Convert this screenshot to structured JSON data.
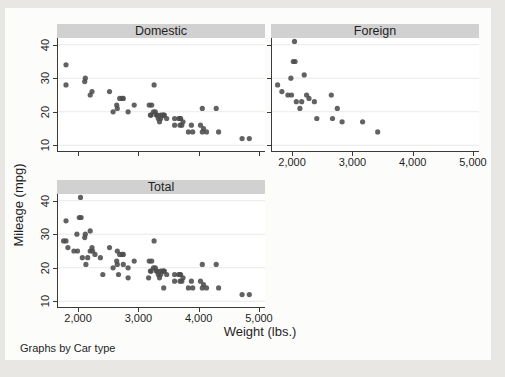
{
  "chart_data": {
    "type": "scatter",
    "xlabel": "Weight (lbs.)",
    "ylabel": "Mileage (mpg)",
    "caption": "Graphs by Car type",
    "legend": "none",
    "grid": true,
    "xlim": [
      1650,
      5100
    ],
    "ylim": [
      8,
      42
    ],
    "x_ticks": [
      {
        "v": 2000,
        "label": "2,000"
      },
      {
        "v": 3000,
        "label": "3,000"
      },
      {
        "v": 4000,
        "label": "4,000"
      },
      {
        "v": 5000,
        "label": "5,000"
      }
    ],
    "y_ticks": [
      {
        "v": 10,
        "label": "10"
      },
      {
        "v": 20,
        "label": "20"
      },
      {
        "v": 30,
        "label": "30"
      },
      {
        "v": 40,
        "label": "40"
      }
    ],
    "colors": {
      "marker": "#4c4c4c",
      "header_bg": "#d1d1d1",
      "grid": "#e9e9e6",
      "axis": "#3a3a3a",
      "text": "#1f1f1f",
      "figure_bg": "#fcfcfb",
      "page_bg": "#e8e7e3"
    },
    "marker_radius": 2.6,
    "panels": [
      {
        "title": "Domestic",
        "points": [
          [
            2930,
            22
          ],
          [
            3350,
            17
          ],
          [
            2640,
            22
          ],
          [
            3250,
            20
          ],
          [
            4080,
            15
          ],
          [
            3670,
            18
          ],
          [
            2230,
            26
          ],
          [
            3280,
            20
          ],
          [
            3880,
            16
          ],
          [
            3400,
            19
          ],
          [
            4330,
            14
          ],
          [
            3900,
            14
          ],
          [
            4290,
            21
          ],
          [
            2110,
            29
          ],
          [
            3690,
            16
          ],
          [
            3180,
            22
          ],
          [
            3220,
            22
          ],
          [
            2750,
            24
          ],
          [
            3430,
            19
          ],
          [
            2120,
            30
          ],
          [
            3600,
            18
          ],
          [
            3600,
            16
          ],
          [
            3740,
            17
          ],
          [
            1800,
            28
          ],
          [
            2650,
            21
          ],
          [
            4840,
            12
          ],
          [
            4720,
            12
          ],
          [
            3830,
            14
          ],
          [
            2580,
            20
          ],
          [
            4060,
            14
          ],
          [
            3720,
            16
          ],
          [
            3370,
            18
          ],
          [
            4130,
            14
          ],
          [
            2830,
            20
          ],
          [
            4060,
            21
          ],
          [
            3310,
            19
          ],
          [
            3300,
            19
          ],
          [
            3690,
            18
          ],
          [
            3370,
            19
          ],
          [
            2730,
            24
          ],
          [
            4030,
            16
          ],
          [
            3260,
            28
          ],
          [
            1800,
            34
          ],
          [
            2200,
            25
          ],
          [
            2520,
            26
          ],
          [
            3330,
            18
          ],
          [
            3700,
            18
          ],
          [
            3470,
            18
          ],
          [
            3210,
            19
          ],
          [
            3200,
            19
          ],
          [
            3420,
            19
          ],
          [
            2690,
            24
          ]
        ]
      },
      {
        "title": "Foreign",
        "points": [
          [
            2830,
            17
          ],
          [
            2070,
            23
          ],
          [
            2650,
            25
          ],
          [
            2370,
            23
          ],
          [
            2020,
            35
          ],
          [
            2280,
            24
          ],
          [
            2750,
            21
          ],
          [
            2130,
            21
          ],
          [
            2240,
            25
          ],
          [
            1760,
            28
          ],
          [
            1980,
            30
          ],
          [
            3420,
            14
          ],
          [
            1830,
            26
          ],
          [
            2050,
            35
          ],
          [
            2410,
            18
          ],
          [
            2200,
            31
          ],
          [
            2670,
            18
          ],
          [
            2160,
            23
          ],
          [
            2040,
            41
          ],
          [
            1930,
            25
          ],
          [
            1990,
            25
          ],
          [
            3170,
            17
          ]
        ]
      },
      {
        "title": "Total",
        "points": [
          [
            2930,
            22
          ],
          [
            3350,
            17
          ],
          [
            2640,
            22
          ],
          [
            3250,
            20
          ],
          [
            4080,
            15
          ],
          [
            3670,
            18
          ],
          [
            2230,
            26
          ],
          [
            3280,
            20
          ],
          [
            3880,
            16
          ],
          [
            3400,
            19
          ],
          [
            4330,
            14
          ],
          [
            3900,
            14
          ],
          [
            4290,
            21
          ],
          [
            2110,
            29
          ],
          [
            3690,
            16
          ],
          [
            3180,
            22
          ],
          [
            3220,
            22
          ],
          [
            2750,
            24
          ],
          [
            3430,
            19
          ],
          [
            2120,
            30
          ],
          [
            3600,
            18
          ],
          [
            3600,
            16
          ],
          [
            3740,
            17
          ],
          [
            1800,
            28
          ],
          [
            2650,
            21
          ],
          [
            4840,
            12
          ],
          [
            4720,
            12
          ],
          [
            3830,
            14
          ],
          [
            2580,
            20
          ],
          [
            4060,
            14
          ],
          [
            3720,
            16
          ],
          [
            3370,
            18
          ],
          [
            4130,
            14
          ],
          [
            2830,
            20
          ],
          [
            4060,
            21
          ],
          [
            3310,
            19
          ],
          [
            3300,
            19
          ],
          [
            3690,
            18
          ],
          [
            3370,
            19
          ],
          [
            2730,
            24
          ],
          [
            4030,
            16
          ],
          [
            3260,
            28
          ],
          [
            1800,
            34
          ],
          [
            2200,
            25
          ],
          [
            2520,
            26
          ],
          [
            3330,
            18
          ],
          [
            3700,
            18
          ],
          [
            3470,
            18
          ],
          [
            3210,
            19
          ],
          [
            3200,
            19
          ],
          [
            3420,
            19
          ],
          [
            2690,
            24
          ],
          [
            2830,
            17
          ],
          [
            2070,
            23
          ],
          [
            2650,
            25
          ],
          [
            2370,
            23
          ],
          [
            2020,
            35
          ],
          [
            2280,
            24
          ],
          [
            2750,
            21
          ],
          [
            2130,
            21
          ],
          [
            2240,
            25
          ],
          [
            1760,
            28
          ],
          [
            1980,
            30
          ],
          [
            3420,
            14
          ],
          [
            1830,
            26
          ],
          [
            2050,
            35
          ],
          [
            2410,
            18
          ],
          [
            2200,
            31
          ],
          [
            2670,
            18
          ],
          [
            2160,
            23
          ],
          [
            2040,
            41
          ],
          [
            1930,
            25
          ],
          [
            1990,
            25
          ],
          [
            3170,
            17
          ]
        ]
      }
    ]
  }
}
